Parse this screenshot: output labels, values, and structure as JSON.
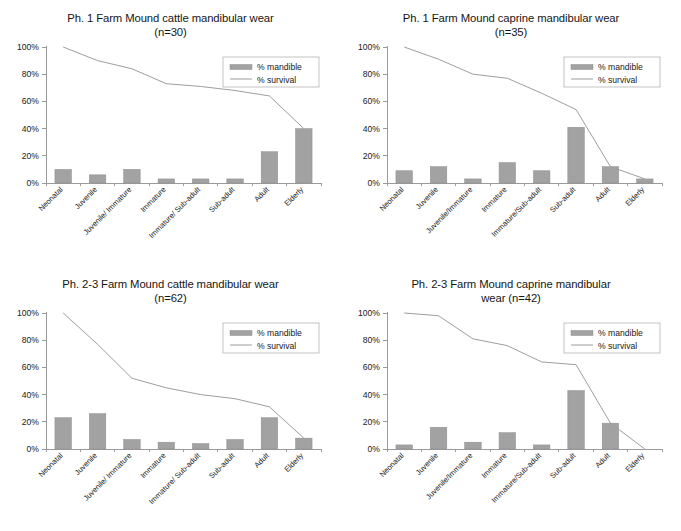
{
  "figure": {
    "background": "#ffffff",
    "bar_color": "#a2a2a2",
    "line_color": "#9e9e9e",
    "axis_color": "#9a9a9a"
  },
  "legend": {
    "mandible_label": "% mandible",
    "survival_label": "% survival",
    "position": "top-right"
  },
  "axis": {
    "yticks": [
      "0%",
      "20%",
      "40%",
      "60%",
      "80%",
      "100%"
    ],
    "ylim": [
      0,
      100
    ]
  },
  "charts": [
    {
      "id": "ph1-cattle",
      "title": "Ph. 1 Farm Mound cattle mandibular wear\n(n=30)"
    },
    {
      "id": "ph1-caprine",
      "title": "Ph. 1 Farm Mound caprine mandibular wear\n(n=35)"
    },
    {
      "id": "ph23-cattle",
      "title": "Ph. 2-3 Farm Mound cattle mandibular wear\n(n=62)"
    },
    {
      "id": "ph23-caprine",
      "title": "Ph. 2-3 Farm Mound caprine mandibular\nwear (n=42)"
    }
  ],
  "chart_data": [
    {
      "type": "bar",
      "title": "Ph. 1 Farm Mound cattle mandibular wear (n=30)",
      "xlabel": "",
      "ylabel": "",
      "ylim": [
        0,
        100
      ],
      "ytick_labels": [
        "0%",
        "20%",
        "40%",
        "60%",
        "80%",
        "100%"
      ],
      "grid": false,
      "legend": [
        "% mandible",
        "% survival"
      ],
      "legend_position": "top-right",
      "categories": [
        "Neonatal",
        "Juvenile",
        "Juvenile/ Immature",
        "Immature",
        "Immature/ Sub-adult",
        "Sub-adult",
        "Adult",
        "Elderly"
      ],
      "series": [
        {
          "name": "% mandible",
          "type": "bar",
          "values": [
            10,
            6,
            10,
            3,
            3,
            3,
            23,
            40
          ]
        },
        {
          "name": "% survival",
          "type": "line",
          "values": [
            100,
            90,
            84,
            73,
            71,
            68,
            64,
            40
          ]
        }
      ]
    },
    {
      "type": "bar",
      "title": "Ph. 1 Farm Mound caprine mandibular wear (n=35)",
      "xlabel": "",
      "ylabel": "",
      "ylim": [
        0,
        100
      ],
      "ytick_labels": [
        "0%",
        "20%",
        "40%",
        "60%",
        "80%",
        "100%"
      ],
      "grid": false,
      "legend": [
        "% mandible",
        "% survival"
      ],
      "legend_position": "top-right",
      "categories": [
        "Neonatal",
        "Juvenile",
        "Juvenile/Immature",
        "Immature",
        "Immature/Sub-adult",
        "Sub-adult",
        "Adult",
        "Elderly"
      ],
      "series": [
        {
          "name": "% mandible",
          "type": "bar",
          "values": [
            9,
            12,
            3,
            15,
            9,
            41,
            12,
            3
          ]
        },
        {
          "name": "% survival",
          "type": "line",
          "values": [
            100,
            91,
            80,
            77,
            66,
            54,
            12,
            3
          ]
        }
      ]
    },
    {
      "type": "bar",
      "title": "Ph. 2-3 Farm Mound cattle mandibular wear (n=62)",
      "xlabel": "",
      "ylabel": "",
      "ylim": [
        0,
        100
      ],
      "ytick_labels": [
        "0%",
        "20%",
        "40%",
        "60%",
        "80%",
        "100%"
      ],
      "grid": false,
      "legend": [
        "% mandible",
        "% survival"
      ],
      "legend_position": "top-right",
      "categories": [
        "Neonatal",
        "Juvenile",
        "Juvenile/ Immature",
        "Immature",
        "Immature/ Sub-adult",
        "Sub-adult",
        "Adult",
        "Elderly"
      ],
      "series": [
        {
          "name": "% mandible",
          "type": "bar",
          "values": [
            23,
            26,
            7,
            5,
            4,
            7,
            23,
            8
          ]
        },
        {
          "name": "% survival",
          "type": "line",
          "values": [
            100,
            77,
            52,
            45,
            40,
            37,
            31,
            8
          ]
        }
      ]
    },
    {
      "type": "bar",
      "title": "Ph. 2-3 Farm Mound caprine mandibular wear (n=42)",
      "xlabel": "",
      "ylabel": "",
      "ylim": [
        0,
        100
      ],
      "ytick_labels": [
        "0%",
        "20%",
        "40%",
        "60%",
        "80%",
        "100%"
      ],
      "grid": false,
      "legend": [
        "% mandible",
        "% survival"
      ],
      "legend_position": "top-right",
      "categories": [
        "Neonatal",
        "Juvenile",
        "Juvenile/Immature",
        "Immature",
        "Immature/Sub-adult",
        "Sub-adult",
        "Adult",
        "Elderly"
      ],
      "series": [
        {
          "name": "% mandible",
          "type": "bar",
          "values": [
            3,
            16,
            5,
            12,
            3,
            43,
            19,
            0
          ]
        },
        {
          "name": "% survival",
          "type": "line",
          "values": [
            100,
            98,
            81,
            76,
            64,
            62,
            19,
            0
          ]
        }
      ]
    }
  ]
}
